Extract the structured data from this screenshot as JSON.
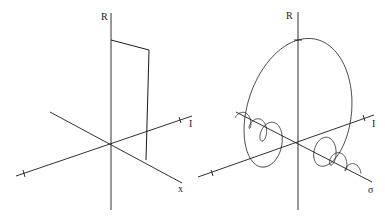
{
  "figure": {
    "left_panel": {
      "labels": {
        "vertical_axis": "R",
        "depth_axis": "I",
        "horizontal_axis": "x"
      },
      "description": "Rectangular pulse in x drawn in 3D (R, I, x) axes; real part only"
    },
    "right_panel": {
      "labels": {
        "vertical_axis": "R",
        "depth_axis": "I",
        "horizontal_axis": "σ"
      },
      "description": "Complex spectrum of the shifted rectangular pulse: oscillating sinc-like helix along σ with central peak in R and a loop in I"
    }
  },
  "chart_data": [
    {
      "type": "line",
      "title": "",
      "axes": [
        "x",
        "I",
        "R"
      ],
      "xlabel": "x",
      "ylabel": "R",
      "zlabel": "I",
      "series": [
        {
          "name": "rectangular pulse",
          "x": [
            0,
            0,
            1,
            1
          ],
          "R": [
            0,
            1,
            1,
            0
          ],
          "I": [
            0,
            0,
            0,
            0
          ]
        }
      ],
      "grid": false,
      "legend": null
    },
    {
      "type": "line",
      "title": "",
      "axes": [
        "σ",
        "I",
        "R"
      ],
      "xlabel": "σ",
      "ylabel": "R",
      "zlabel": "I",
      "series": [
        {
          "name": "Fourier transform (complex)",
          "form": "R = sin(2πσa)/(πσ) style sinc peak at σ=0, I = (1-cos)/σ loop",
          "peak_R": 1.0
        }
      ],
      "grid": false,
      "legend": null
    }
  ]
}
